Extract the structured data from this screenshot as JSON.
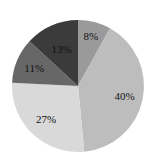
{
  "chart_data": {
    "type": "pie",
    "title": "",
    "categories": [
      "A",
      "B",
      "C",
      "D",
      "E"
    ],
    "values": [
      8,
      40,
      27,
      11,
      13
    ],
    "labels": [
      "8%",
      "40%",
      "27%",
      "11%",
      "13%"
    ],
    "colors": [
      "#9a9a9a",
      "#bdbdbd",
      "#d9d9d9",
      "#676767",
      "#3b3b3b"
    ],
    "start_angle_deg": -90,
    "direction": "clockwise",
    "legend": false
  }
}
